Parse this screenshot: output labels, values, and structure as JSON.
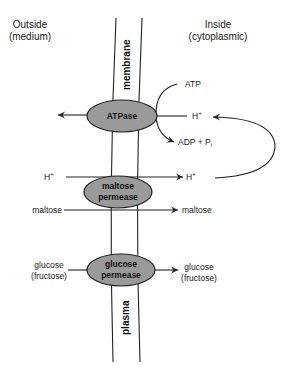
{
  "headers": {
    "outside_line1": "Outside",
    "outside_line2": "(medium)",
    "inside_line1": "Inside",
    "inside_line2": "(cytoplasmic)"
  },
  "membrane": {
    "label_top": "membrane",
    "label_bottom": "plasma"
  },
  "enzymes": {
    "atpase": "ATPase",
    "maltose_permease_line1": "maltose",
    "maltose_permease_line2": "permease",
    "glucose_permease_line1": "glucose",
    "glucose_permease_line2": "permease"
  },
  "labels": {
    "atp": "ATP",
    "h_plus_inside_top": "H",
    "h_plus_sup": "+",
    "adp_pi": "ADP + P",
    "pi_sub": "i",
    "h_plus_outside": "H",
    "h_plus_inside_bottom": "H",
    "maltose_outside": "maltose",
    "maltose_inside": "maltose",
    "glucose_outside_line1": "glucose",
    "glucose_outside_line2": "(fructose)",
    "glucose_inside_line1": "glucose",
    "glucose_inside_line2": "(fructose)"
  },
  "colors": {
    "enzyme_fill": "#9a9a9a",
    "line": "#222222"
  }
}
